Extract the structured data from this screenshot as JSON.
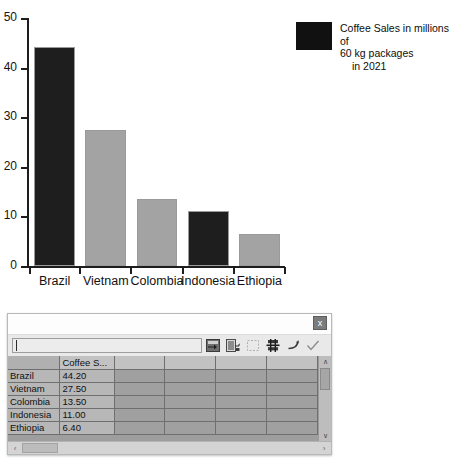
{
  "chart_data": {
    "type": "bar",
    "title": "",
    "xlabel": "",
    "ylabel": "",
    "categories": [
      "Brazil",
      "Vietnam",
      "Colombia",
      "Indonesia",
      "Ethiopia"
    ],
    "values": [
      44.2,
      27.5,
      13.5,
      11.0,
      6.4
    ],
    "bar_colors": [
      "#1e1e1e",
      "#a3a3a3",
      "#a3a3a3",
      "#1e1e1e",
      "#a3a3a3"
    ],
    "ylim": [
      0,
      50
    ],
    "yticks": [
      0,
      10,
      20,
      30,
      40,
      50
    ],
    "ytick_labels": [
      "0",
      "10",
      "20",
      "30",
      "40",
      "50"
    ],
    "grid": false,
    "legend": {
      "position": "right",
      "entries": [
        {
          "label": "Coffee Sales in millions of 60 kg packages in 2021",
          "line1": "Coffee Sales in millions of",
          "line2": "60 kg packages",
          "line3": "in 2021",
          "color": "#111111"
        }
      ]
    }
  },
  "dialog": {
    "close_label": "x",
    "formula_value": "",
    "toolbar": [
      {
        "name": "insert-row-icon",
        "title": "Insert Row"
      },
      {
        "name": "insert-series-icon",
        "title": "Insert Series"
      },
      {
        "name": "insert-text-column-icon",
        "title": "Insert Text Column"
      },
      {
        "name": "delete-row-icon",
        "title": "Delete Row"
      },
      {
        "name": "move-series-left-icon",
        "title": "Move Series Left"
      },
      {
        "name": "accept-icon",
        "title": "Accept"
      }
    ],
    "grid": {
      "columns": [
        "",
        "Coffee S...",
        "",
        "",
        "",
        ""
      ],
      "rows": [
        {
          "label": "Brazil",
          "value": "44.20"
        },
        {
          "label": "Vietnam",
          "value": "27.50"
        },
        {
          "label": "Colombia",
          "value": "13.50"
        },
        {
          "label": "Indonesia",
          "value": "11.00"
        },
        {
          "label": "Ethiopia",
          "value": "6.40"
        }
      ]
    },
    "scroll": {
      "up_arrow": "∧",
      "down_arrow": "∨",
      "left_arrow": "‹",
      "right_arrow": "›"
    }
  }
}
